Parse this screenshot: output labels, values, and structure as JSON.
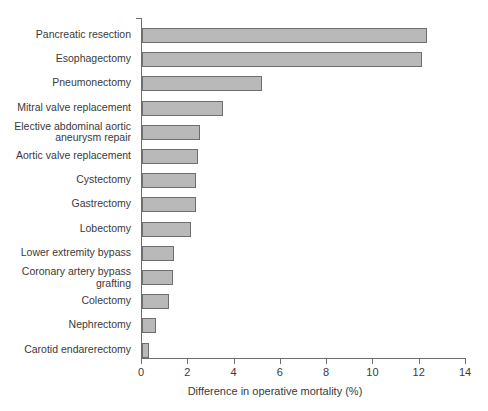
{
  "chart_data": {
    "type": "bar",
    "orientation": "horizontal",
    "title": "",
    "xlabel": "Difference in operative mortality (%)",
    "ylabel": "",
    "xlim": [
      0,
      14
    ],
    "xticks": [
      0,
      2,
      4,
      6,
      8,
      10,
      12,
      14
    ],
    "xtick_labels": [
      "0",
      "2",
      "4",
      "6",
      "8",
      "10",
      "12",
      "14"
    ],
    "grid": false,
    "legend": false,
    "bar_fill_color": "#b9b9b9",
    "bar_edge_color": "#6e6e6e",
    "axis_color": "#6e6e6e",
    "categories": [
      "Pancreatic resection",
      "Esophagectomy",
      "Pneumonectomy",
      "Mitral valve replacement",
      "Elective abdominal aortic\naneurysm repair",
      "Aortic valve replacement",
      "Cystectomy",
      "Gastrectomy",
      "Lobectomy",
      "Lower extremity bypass",
      "Coronary artery bypass\ngrafting",
      "Colectomy",
      "Nephrectomy",
      "Carotid endarerectomy"
    ],
    "values": [
      12.3,
      12.1,
      5.2,
      3.5,
      2.5,
      2.4,
      2.35,
      2.35,
      2.1,
      1.4,
      1.35,
      1.15,
      0.6,
      0.3
    ]
  }
}
